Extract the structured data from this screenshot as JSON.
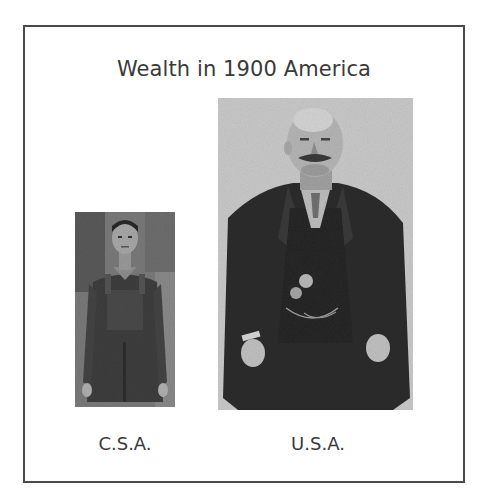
{
  "slide": {
    "title": "Wealth in 1900 America",
    "border_color": "#4a4a4a",
    "figures": [
      {
        "id": "csa",
        "caption": "C.S.A.",
        "image_description": "Small black-and-white photo of a thin working man in worn overalls"
      },
      {
        "id": "usa",
        "caption": "U.S.A.",
        "image_description": "Large black-and-white portrait of a heavy-set wealthy man with mustache in dark suit, vest with pocket watch chain"
      }
    ]
  }
}
